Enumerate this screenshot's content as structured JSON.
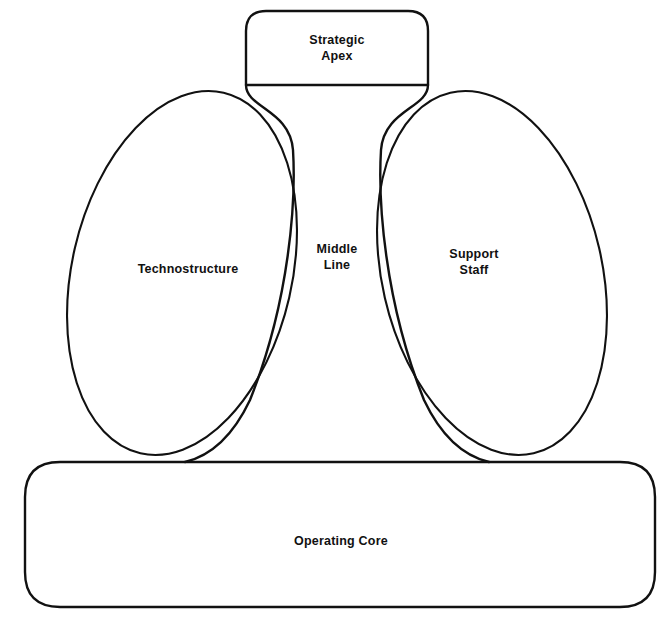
{
  "diagram": {
    "stroke_color": "#111111",
    "background_color": "#ffffff",
    "text_color": "#111111",
    "parts": {
      "strategic_apex": {
        "label": "Strategic\nApex",
        "shape": "rounded-rectangle",
        "position": "top-center"
      },
      "middle_line": {
        "label": "Middle\nLine",
        "shape": "funnel",
        "position": "center"
      },
      "technostructure": {
        "label": "Technostructure",
        "shape": "tilted-ellipse",
        "position": "left"
      },
      "support_staff": {
        "label": "Support\nStaff",
        "shape": "tilted-ellipse",
        "position": "right"
      },
      "operating_core": {
        "label": "Operating Core",
        "shape": "rounded-rectangle",
        "position": "bottom-wide"
      }
    }
  }
}
